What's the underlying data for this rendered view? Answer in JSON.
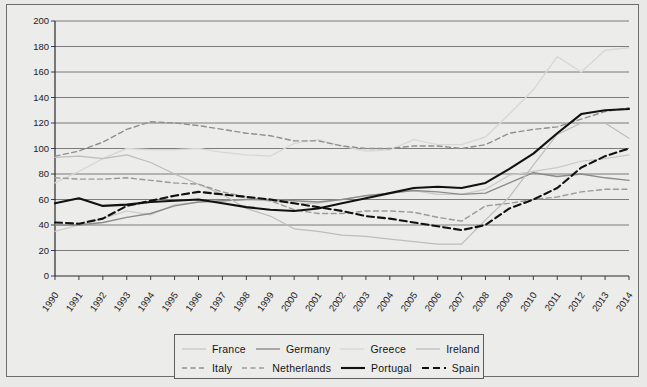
{
  "figure": {
    "background_color": "#e9e9e7",
    "plot_background_color": "#ececea",
    "frame_color": "#6d6d6d"
  },
  "legend": {
    "position": "bottom-center",
    "rows": [
      [
        {
          "label": "France",
          "key": "france"
        },
        {
          "label": "Germany",
          "key": "germany"
        },
        {
          "label": "Greece",
          "key": "greece"
        },
        {
          "label": "Ireland",
          "key": "ireland"
        }
      ],
      [
        {
          "label": "Italy",
          "key": "italy"
        },
        {
          "label": "Netherlands",
          "key": "netherlands"
        },
        {
          "label": "Portugal",
          "key": "portugal"
        },
        {
          "label": "Spain",
          "key": "spain"
        }
      ]
    ]
  },
  "chart_data": {
    "type": "line",
    "title": "",
    "subtitle": "",
    "xlabel": "",
    "ylabel": "",
    "grid": true,
    "legend_position": "bottom-center",
    "xlim": [
      1990,
      2014
    ],
    "ylim": [
      0,
      200
    ],
    "ytick_step": 20,
    "yticks": [
      0,
      20,
      40,
      60,
      80,
      100,
      120,
      140,
      160,
      180,
      200
    ],
    "categories": [
      "1990",
      "1991",
      "1992",
      "1993",
      "1994",
      "1995",
      "1996",
      "1997",
      "1998",
      "1999",
      "2000",
      "2001",
      "2002",
      "2003",
      "2004",
      "2005",
      "2006",
      "2007",
      "2008",
      "2009",
      "2010",
      "2011",
      "2012",
      "2013",
      "2014"
    ],
    "series": [
      {
        "name": "France",
        "color": "#c9c9c9",
        "style": "solid",
        "width": 1.2,
        "values": [
          35,
          40,
          45,
          51,
          48,
          56,
          58,
          59,
          60,
          59,
          57,
          57,
          60,
          63,
          65,
          67,
          64,
          64,
          68,
          79,
          82,
          85,
          90,
          92,
          95
        ]
      },
      {
        "name": "Germany",
        "color": "#8c8c8c",
        "style": "solid",
        "width": 1.4,
        "values": [
          40,
          40,
          42,
          46,
          49,
          55,
          58,
          59,
          60,
          60,
          59,
          58,
          60,
          63,
          65,
          67,
          66,
          64,
          65,
          73,
          81,
          78,
          80,
          77,
          75
        ]
      },
      {
        "name": "Greece",
        "color": "#d8d8d8",
        "style": "solid",
        "width": 1.4,
        "values": [
          73,
          82,
          92,
          100,
          99,
          99,
          100,
          97,
          95,
          94,
          104,
          107,
          102,
          98,
          99,
          107,
          103,
          103,
          109,
          127,
          146,
          172,
          160,
          177,
          179
        ]
      },
      {
        "name": "Ireland",
        "color": "#bdbdbd",
        "style": "solid",
        "width": 1.2,
        "values": [
          93,
          94,
          92,
          95,
          89,
          80,
          72,
          64,
          53,
          47,
          37,
          35,
          32,
          31,
          29,
          27,
          25,
          25,
          44,
          62,
          87,
          111,
          120,
          120,
          108
        ]
      },
      {
        "name": "Italy",
        "color": "#8f8f8f",
        "style": "dashed",
        "width": 1.4,
        "values": [
          94,
          98,
          105,
          115,
          121,
          120,
          118,
          115,
          112,
          110,
          106,
          106,
          102,
          100,
          100,
          102,
          102,
          100,
          103,
          112,
          115,
          117,
          123,
          129,
          132
        ]
      },
      {
        "name": "Netherlands",
        "color": "#9a9a9a",
        "style": "dashed",
        "width": 1.4,
        "values": [
          77,
          76,
          76,
          77,
          75,
          73,
          72,
          66,
          62,
          59,
          52,
          49,
          49,
          51,
          51,
          50,
          46,
          43,
          55,
          57,
          60,
          62,
          66,
          68,
          68
        ]
      },
      {
        "name": "Portugal",
        "color": "#111111",
        "style": "solid",
        "width": 2.1,
        "values": [
          57,
          61,
          55,
          56,
          58,
          59,
          60,
          57,
          54,
          52,
          51,
          53,
          57,
          61,
          65,
          69,
          70,
          69,
          73,
          84,
          96,
          112,
          127,
          130,
          131
        ]
      },
      {
        "name": "Spain",
        "color": "#111111",
        "style": "dashed",
        "width": 2.1,
        "values": [
          42,
          41,
          45,
          55,
          59,
          63,
          66,
          64,
          62,
          60,
          57,
          54,
          51,
          47,
          45,
          42,
          39,
          36,
          40,
          53,
          60,
          69,
          85,
          94,
          100
        ]
      }
    ]
  }
}
